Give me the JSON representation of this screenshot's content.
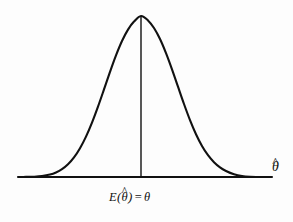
{
  "figure": {
    "title": "",
    "background_color": "#fdfdfd",
    "stroke_color": "#111111",
    "axis": {
      "label": "θ̂",
      "label_symbol": "θ",
      "label_accent": "^",
      "line_start_x": 18,
      "line_end_x": 272,
      "line_y": 177,
      "line_width": 2
    },
    "center_line": {
      "name": "mean-vertical-line",
      "x": 141,
      "y_top": 16,
      "y_bottom": 177,
      "line_width": 1.4
    },
    "mean_label": {
      "full": "E(θ̂) = θ",
      "expectation_symbol": "E",
      "open_paren": "(",
      "estimator_symbol": "θ",
      "estimator_accent": "^",
      "close_paren": ")",
      "equals": "=",
      "parameter_symbol": "θ"
    }
  },
  "chart_data": {
    "type": "line",
    "title": "",
    "xlabel": "θ̂",
    "ylabel": "",
    "grid": false,
    "legend": null,
    "annotations": [
      {
        "text": "E(θ̂) = θ",
        "x_px": 141,
        "y_px": 196
      },
      {
        "text": "θ̂",
        "x_px": 278,
        "y_px": 170
      }
    ],
    "curve": {
      "name": "sampling-distribution-curve",
      "shape": "gaussian",
      "peak_x_px": 141,
      "peak_y_px": 16,
      "baseline_y_px": 177,
      "left_foot_x_px": 52,
      "right_foot_x_px": 240,
      "sigma_px": 29,
      "stroke_width": 2.1,
      "x": [
        18,
        26,
        34,
        42,
        50,
        56,
        62,
        68,
        74,
        80,
        86,
        92,
        98,
        104,
        110,
        116,
        122,
        128,
        134,
        141,
        148,
        154,
        160,
        166,
        172,
        178,
        184,
        190,
        196,
        202,
        208,
        214,
        220,
        226,
        234,
        242,
        250,
        258,
        266,
        272
      ],
      "y": [
        177.0,
        176.9,
        176.7,
        176.1,
        174.6,
        172.5,
        169.2,
        164.3,
        157.4,
        148.2,
        136.6,
        122.6,
        106.6,
        89.4,
        71.9,
        55.4,
        41.0,
        29.6,
        21.6,
        16.0,
        20.4,
        28.0,
        39.0,
        53.1,
        69.3,
        86.7,
        104.0,
        120.1,
        134.2,
        145.9,
        155.2,
        162.2,
        167.4,
        171.0,
        174.3,
        176.1,
        176.8,
        176.95,
        177.0,
        177.0
      ]
    }
  }
}
